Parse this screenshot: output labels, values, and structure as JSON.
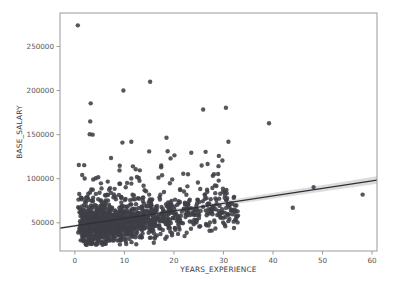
{
  "figure": {
    "background_color": "#ffffff",
    "width": 396,
    "height": 291
  },
  "chart_data": {
    "type": "scatter",
    "title": "",
    "subtitle": "",
    "xlabel": "YEARS_EXPERIENCE",
    "ylabel": "BASE_SALARY",
    "xlim": [
      -3,
      61
    ],
    "ylim": [
      18000,
      288000
    ],
    "xticks": [
      0,
      10,
      20,
      30,
      40,
      50,
      60
    ],
    "xtick_labels": [
      "0",
      "10",
      "20",
      "30",
      "40",
      "50",
      "60"
    ],
    "yticks": [
      50000,
      100000,
      150000,
      200000,
      250000
    ],
    "ytick_labels": [
      "50000",
      "100000",
      "150000",
      "200000",
      "250000"
    ],
    "grid": false,
    "legend": null,
    "marker_color": "#3f3f47",
    "marker_size": 4.4,
    "marker_opacity": 0.88,
    "regression": {
      "present": true,
      "line_color": "#2f2f36",
      "band_color": "#8a8a90",
      "x_start": -3,
      "x_end": 61,
      "y_start": 44000,
      "y_end": 98500,
      "slope": 852,
      "intercept": 46556,
      "ci_half_width_start": 1200,
      "ci_half_width_end": 4200
    },
    "n_points_visible": 1240,
    "notable_outliers": [
      {
        "x": 0.6,
        "y": 274000
      },
      {
        "x": 15.2,
        "y": 210000
      },
      {
        "x": 9.8,
        "y": 200000
      },
      {
        "x": 3.2,
        "y": 185500
      },
      {
        "x": 30.5,
        "y": 180500
      },
      {
        "x": 25.9,
        "y": 178500
      },
      {
        "x": 3.1,
        "y": 165000
      },
      {
        "x": 39.2,
        "y": 163000
      },
      {
        "x": 3.0,
        "y": 150500
      },
      {
        "x": 3.6,
        "y": 150000
      },
      {
        "x": 18.5,
        "y": 146500
      },
      {
        "x": 31.0,
        "y": 142000
      },
      {
        "x": 9.6,
        "y": 141000
      },
      {
        "x": 11.4,
        "y": 142000
      },
      {
        "x": 15.0,
        "y": 131000
      },
      {
        "x": 26.4,
        "y": 130500
      },
      {
        "x": 23.5,
        "y": 129500
      },
      {
        "x": 20.1,
        "y": 126500
      },
      {
        "x": 7.3,
        "y": 123500
      },
      {
        "x": 0.8,
        "y": 115500
      },
      {
        "x": 25.6,
        "y": 115000
      },
      {
        "x": 48.2,
        "y": 90500
      },
      {
        "x": 58.1,
        "y": 82000
      },
      {
        "x": 44.0,
        "y": 67000
      }
    ],
    "cluster_description": {
      "x_range": [
        0,
        39
      ],
      "y_core_range": [
        25000,
        85000
      ],
      "y_floor": 25000,
      "densest_x_range": [
        1,
        30
      ],
      "densest_y_range": [
        28000,
        68000
      ]
    },
    "point_seed": 20240517
  }
}
